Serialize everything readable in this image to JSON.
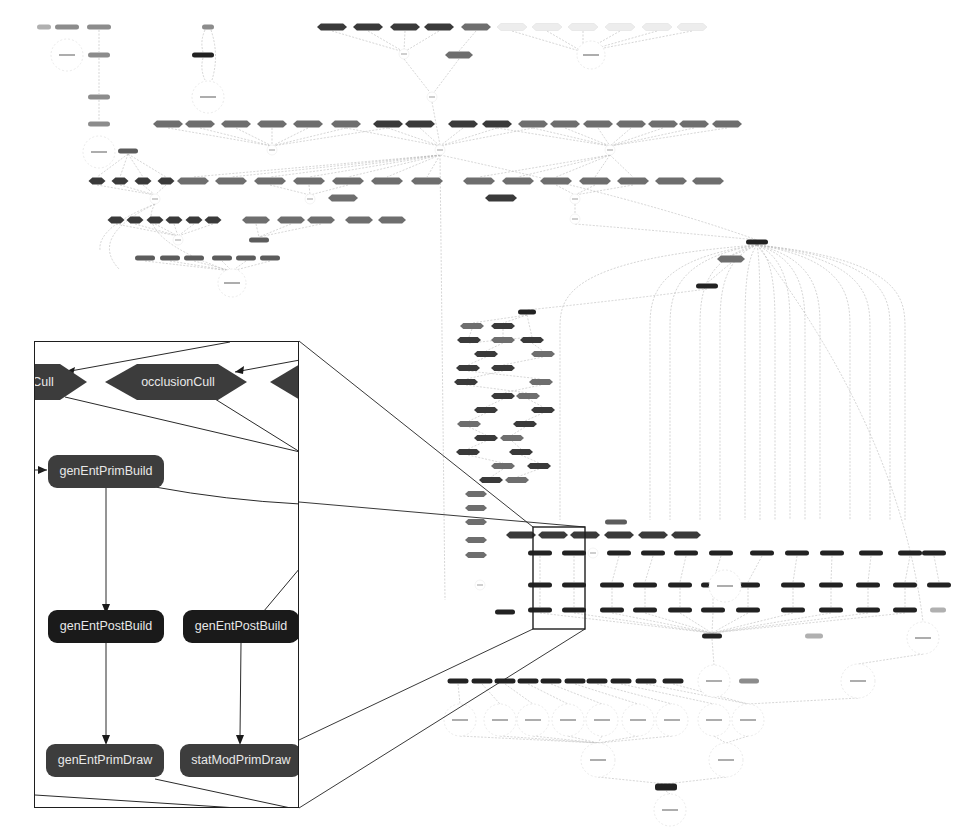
{
  "diagram": {
    "kind": "render-task dependency graph (overview with magnified inset)",
    "overview_note": "Node labels in the overview graph are too small to read at screenshot resolution",
    "colors": {
      "node_dark": "#222222",
      "node_hex_dark": "#3a3a3a",
      "node_hex_mid": "#6e6e6e",
      "node_gray": "#8c8c8c",
      "node_light": "#ededed",
      "edge": "#b8b8b8",
      "inset_border": "#1e1e1e",
      "inset_node_text": "#e8e8e8"
    }
  },
  "inset": {
    "nodes": [
      {
        "id": "cull-left",
        "label": "Cull",
        "shape": "hexagon"
      },
      {
        "id": "occlusion-cull",
        "label": "occlusionCull",
        "shape": "hexagon"
      },
      {
        "id": "hex-right-partial",
        "label": "",
        "shape": "hexagon"
      },
      {
        "id": "gen-ent-prim-build",
        "label": "genEntPrimBuild",
        "shape": "rounded-rect"
      },
      {
        "id": "gen-ent-post-build-1",
        "label": "genEntPostBuild",
        "shape": "rounded-rect"
      },
      {
        "id": "gen-ent-post-build-2",
        "label": "genEntPostBuild",
        "shape": "rounded-rect"
      },
      {
        "id": "gen-ent-prim-draw",
        "label": "genEntPrimDraw",
        "shape": "rounded-rect"
      },
      {
        "id": "stat-mod-prim-draw",
        "label": "statModPrimDraw",
        "shape": "rounded-rect"
      }
    ],
    "edges": [
      [
        "gen-ent-prim-build",
        "gen-ent-post-build-1"
      ],
      [
        "gen-ent-post-build-1",
        "gen-ent-prim-draw"
      ],
      [
        "gen-ent-post-build-2",
        "stat-mod-prim-draw"
      ]
    ]
  }
}
